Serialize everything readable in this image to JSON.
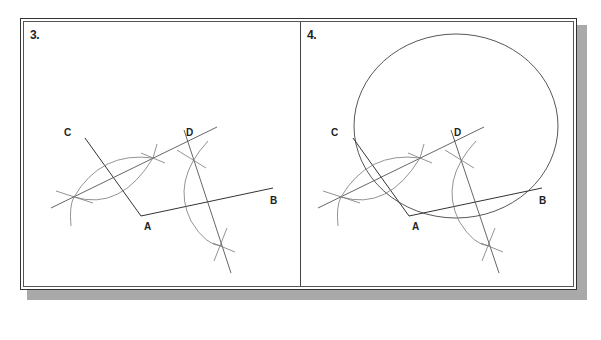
{
  "figure": {
    "type": "geometric-construction",
    "colors": {
      "line": "#333333",
      "construction": "#777777",
      "shadow": "#a9a9a9",
      "frame": "#333333"
    },
    "panels": [
      {
        "step_label": "3.",
        "points": {
          "A": "A",
          "B": "B",
          "C": "C",
          "D": "D"
        },
        "shows_circle": false
      },
      {
        "step_label": "4.",
        "points": {
          "A": "A",
          "B": "B",
          "C": "C",
          "D": "D"
        },
        "shows_circle": true
      }
    ]
  }
}
